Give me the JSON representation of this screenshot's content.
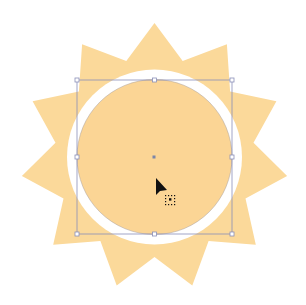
{
  "artwork": {
    "name": "sun",
    "ray_count": 11,
    "colors": {
      "rays": "#FBD99A",
      "ring_gap": "#FFFFFF",
      "core": "#FBD595",
      "selection": "#8A8FB8",
      "center_point": "#7C86A8",
      "cursor": "#111111"
    }
  },
  "selection": {
    "target": "sun-core-circle",
    "handles": [
      "top-left",
      "top",
      "top-right",
      "right",
      "bottom-right",
      "bottom",
      "bottom-left",
      "left"
    ]
  },
  "cursor": {
    "type": "move-arrow-icon"
  }
}
